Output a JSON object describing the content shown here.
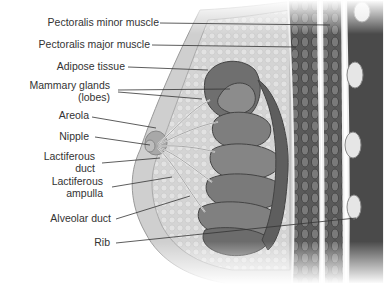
{
  "diagram": {
    "labels": [
      {
        "id": "pectoralis-minor",
        "text": "Pectoralis minor muscle"
      },
      {
        "id": "pectoralis-major",
        "text": "Pectoralis major muscle"
      },
      {
        "id": "adipose",
        "text": "Adipose tissue"
      },
      {
        "id": "mammary-1",
        "text": "Mammary glands"
      },
      {
        "id": "mammary-2",
        "text": "(lobes)"
      },
      {
        "id": "areola",
        "text": "Areola"
      },
      {
        "id": "nipple",
        "text": "Nipple"
      },
      {
        "id": "lact-duct-1",
        "text": "Lactiferous"
      },
      {
        "id": "lact-duct-2",
        "text": "duct"
      },
      {
        "id": "lact-amp-1",
        "text": "Lactiferous"
      },
      {
        "id": "lact-amp-2",
        "text": "ampulla"
      },
      {
        "id": "alveolar",
        "text": "Alveolar duct"
      },
      {
        "id": "rib",
        "text": "Rib"
      }
    ]
  }
}
